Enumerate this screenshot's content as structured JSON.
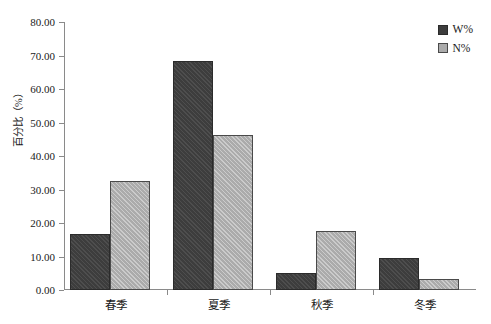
{
  "chart_data": {
    "type": "bar",
    "title": "",
    "subtitle": "",
    "xlabel": "",
    "ylabel": "百分比（%）",
    "categories": [
      "春季",
      "夏季",
      "秋季",
      "冬季"
    ],
    "series": [
      {
        "name": "W%",
        "values": [
          16.6,
          68.5,
          5.1,
          9.6
        ],
        "color": "#3d3d3d"
      },
      {
        "name": "N%",
        "values": [
          32.6,
          46.2,
          17.7,
          3.2
        ],
        "color": "#ababab"
      }
    ],
    "ylim": [
      0,
      80
    ],
    "ytick_step": 10,
    "ytick_labels": [
      "0.00",
      "10.00",
      "20.00",
      "30.00",
      "40.00",
      "50.00",
      "60.00",
      "70.00",
      "80.00"
    ],
    "ytick_values": [
      0,
      10,
      20,
      30,
      40,
      50,
      60,
      70,
      80
    ],
    "grid": false,
    "legend_position": "top-right"
  },
  "legend": {
    "entries": [
      {
        "label": "W%"
      },
      {
        "label": "N%"
      }
    ]
  }
}
